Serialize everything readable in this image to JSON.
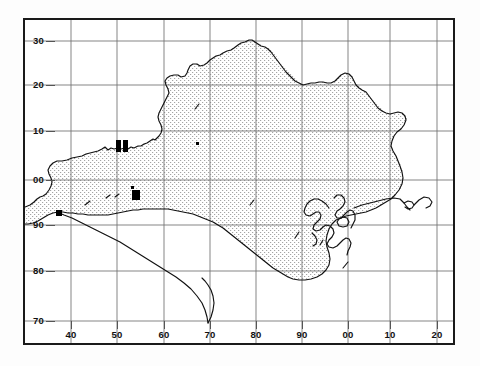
{
  "figure": {
    "kind": "distribution-map",
    "region": "Dorset vice-county (UK) 10 km grid distribution map",
    "background_color": "#ffffff",
    "frame_color": "#1a1a1a",
    "grid_color": "#6a6a6a",
    "land_fill_color": "#8a8a8a",
    "coast_color": "#111111",
    "marker_color": "#000000"
  },
  "axes": {
    "x_ticks": [
      {
        "label": "40",
        "value": 40,
        "px": 71
      },
      {
        "label": "50",
        "value": 50,
        "px": 117
      },
      {
        "label": "60",
        "value": 60,
        "px": 164
      },
      {
        "label": "70",
        "value": 70,
        "px": 210
      },
      {
        "label": "80",
        "value": 80,
        "px": 256
      },
      {
        "label": "90",
        "value": 90,
        "px": 302
      },
      {
        "label": "00",
        "value": 100,
        "px": 348
      },
      {
        "label": "10",
        "value": 110,
        "px": 390
      },
      {
        "label": "20",
        "value": 120,
        "px": 437
      }
    ],
    "y_ticks": [
      {
        "label": "30",
        "value": 30,
        "px": 41
      },
      {
        "label": "20",
        "value": 20,
        "px": 85
      },
      {
        "label": "10",
        "value": 10,
        "px": 131
      },
      {
        "label": "00",
        "value": 0,
        "px": 180
      },
      {
        "label": "90",
        "value": -10,
        "px": 225
      },
      {
        "label": "80",
        "value": -20,
        "px": 271
      },
      {
        "label": "70",
        "value": -30,
        "px": 321
      }
    ]
  },
  "chart_data": {
    "type": "scatter",
    "title": "",
    "xlabel": "",
    "ylabel": "",
    "grid": true,
    "legend": null,
    "xlim": [
      35,
      125
    ],
    "ylim": [
      -35,
      35
    ],
    "note": "Filled black squares mark occupied 10 km / 2 km grid squares; dotted shading indicates land area of the recording region.",
    "records": [
      {
        "id": "rec-1",
        "x": 51,
        "y": 8,
        "size": "large",
        "px": [
          116,
          140,
          5,
          12
        ]
      },
      {
        "id": "rec-2",
        "x": 52,
        "y": 8,
        "size": "large",
        "px": [
          123,
          140,
          5,
          12
        ]
      },
      {
        "id": "rec-3",
        "x": 53,
        "y": 1,
        "size": "large",
        "px": [
          132,
          190,
          8,
          10
        ]
      },
      {
        "id": "rec-4",
        "x": 53,
        "y": 2,
        "size": "small",
        "px": [
          131,
          186,
          3,
          3
        ]
      },
      {
        "id": "rec-5",
        "x": 44,
        "y": -6,
        "size": "small",
        "px": [
          56,
          210,
          6,
          6
        ]
      },
      {
        "id": "rec-6",
        "x": 68,
        "y": 7,
        "size": "dot",
        "px": [
          196,
          142,
          3,
          3
        ]
      }
    ]
  }
}
